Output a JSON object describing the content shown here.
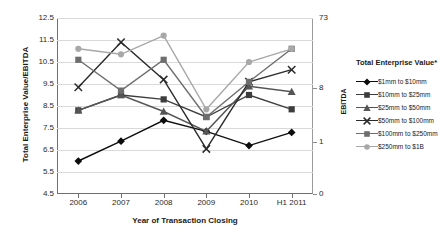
{
  "chart_data": {
    "type": "line",
    "title": "",
    "xlabel": "Year of Transaction Closing",
    "ylabel": "Total Enterprise Value/EBITDA",
    "ylabel_right": "EBITDA",
    "categories": [
      "2006",
      "2007",
      "2008",
      "2009",
      "2010",
      "H1 2011"
    ],
    "ylim": [
      4.5,
      12.5
    ],
    "yticks": [
      "12.5",
      "11.5",
      "10.5",
      "9.5",
      "8.5",
      "7.5",
      "6.5",
      "5.5",
      "4.5"
    ],
    "yticks_right": [
      "73",
      "8",
      "1",
      "0"
    ],
    "yticks_right_positions": [
      12.5,
      9.3,
      6.85,
      4.5
    ],
    "grid": true,
    "legend_position": "right",
    "legend_title": "Total Enterprise Value*",
    "series": [
      {
        "name": "$1mm to $10mm",
        "marker": "diamond",
        "color": "#0d0d0d",
        "values": [
          6.0,
          6.9,
          7.85,
          7.35,
          6.7,
          7.3
        ]
      },
      {
        "name": "$10mm to $25mm",
        "marker": "square",
        "color": "#3d3d3d",
        "values": [
          8.3,
          9.0,
          8.8,
          8.0,
          9.0,
          8.35
        ]
      },
      {
        "name": "$25mm to $50mm",
        "marker": "triangle",
        "color": "#555555",
        "values": [
          8.3,
          9.0,
          8.25,
          7.35,
          9.4,
          9.15
        ]
      },
      {
        "name": "$50mm to $100mm",
        "marker": "cross",
        "color": "#2b2b2b",
        "values": [
          9.35,
          11.4,
          9.7,
          6.55,
          9.6,
          10.15
        ]
      },
      {
        "name": "$100mm to $250mm",
        "marker": "square",
        "color": "#6e6e6e",
        "values": [
          10.6,
          9.2,
          10.6,
          8.0,
          9.6,
          11.1
        ]
      },
      {
        "name": "$250mm to $1B",
        "marker": "circle",
        "color": "#a8a8a8",
        "values": [
          11.1,
          10.85,
          11.7,
          8.35,
          10.5,
          11.1
        ]
      }
    ]
  }
}
